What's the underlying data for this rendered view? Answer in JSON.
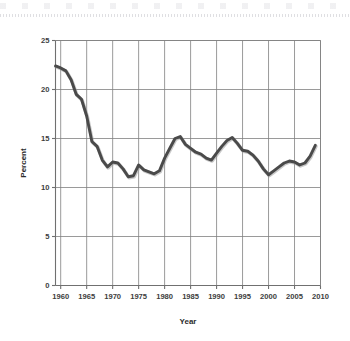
{
  "chart_data": {
    "type": "line",
    "title": "",
    "xlabel": "Year",
    "ylabel": "Percent",
    "xlim": [
      1959,
      2010
    ],
    "ylim": [
      0,
      25
    ],
    "xticks": [
      1960,
      1965,
      1970,
      1975,
      1980,
      1985,
      1990,
      1995,
      2000,
      2005,
      2010
    ],
    "xtick_labels": [
      "1960",
      "1965",
      "1970",
      "1975",
      "1980",
      "1985",
      "1990",
      "1995",
      "2000",
      "2005",
      "2010"
    ],
    "yticks": [
      0,
      5,
      10,
      15,
      20,
      25
    ],
    "ytick_labels": [
      "0",
      "5",
      "10",
      "15",
      "20",
      "25"
    ],
    "grid": true,
    "grid_axis": "both",
    "legend": false,
    "legend_position": "none",
    "line_color": "#4a4a4a",
    "grid_color": "#808080",
    "axis_color": "#707070",
    "background_color": "#ffffff",
    "series": [
      {
        "name": "Percent",
        "color": "#4a4a4a",
        "x": [
          1959,
          1960,
          1961,
          1962,
          1963,
          1964,
          1965,
          1966,
          1967,
          1968,
          1969,
          1970,
          1971,
          1972,
          1973,
          1974,
          1975,
          1976,
          1977,
          1978,
          1979,
          1980,
          1981,
          1982,
          1983,
          1984,
          1985,
          1986,
          1987,
          1988,
          1989,
          1990,
          1991,
          1992,
          1993,
          1994,
          1995,
          1996,
          1997,
          1998,
          1999,
          2000,
          2001,
          2002,
          2003,
          2004,
          2005,
          2006,
          2007,
          2008,
          2009
        ],
        "values": [
          22.4,
          22.2,
          21.9,
          21.0,
          19.5,
          19.0,
          17.3,
          14.7,
          14.2,
          12.8,
          12.1,
          12.6,
          12.5,
          11.9,
          11.1,
          11.2,
          12.3,
          11.8,
          11.6,
          11.4,
          11.7,
          13.0,
          14.0,
          15.0,
          15.2,
          14.4,
          14.0,
          13.6,
          13.4,
          13.0,
          12.8,
          13.5,
          14.2,
          14.8,
          15.1,
          14.5,
          13.8,
          13.7,
          13.3,
          12.7,
          11.9,
          11.3,
          11.7,
          12.1,
          12.5,
          12.7,
          12.6,
          12.3,
          12.5,
          13.2,
          14.3
        ]
      }
    ]
  }
}
